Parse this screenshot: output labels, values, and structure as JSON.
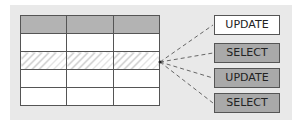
{
  "diagram": {
    "table": {
      "columns": 3,
      "rows": [
        {
          "type": "header",
          "fill": "#b3b3b3"
        },
        {
          "type": "normal"
        },
        {
          "type": "hatched"
        },
        {
          "type": "normal"
        },
        {
          "type": "normal"
        }
      ]
    },
    "operations": [
      {
        "label": "UPDATE",
        "fill": "#ffffff"
      },
      {
        "label": "SELECT",
        "fill": "#a9a9a9"
      },
      {
        "label": "UPDATE",
        "fill": "#a9a9a9"
      },
      {
        "label": "SELECT",
        "fill": "#a9a9a9"
      }
    ],
    "connector": {
      "style": "dashed",
      "color": "#666666",
      "origin": "hatched row right edge"
    },
    "colors": {
      "background": "#e9e9e9",
      "border": "#555555"
    }
  }
}
